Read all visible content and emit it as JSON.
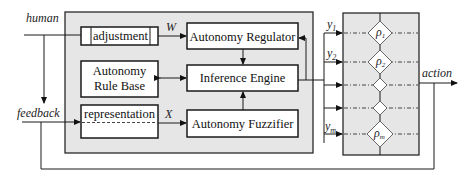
{
  "diagram": {
    "inputs": {
      "human": "human",
      "feedback": "feedback"
    },
    "output": "action",
    "blocks": {
      "adjustment": "adjustment",
      "rule_base_line1": "Autonomy",
      "rule_base_line2": "Rule Base",
      "representation": "representation",
      "regulator": "Autonomy Regulator",
      "inference": "Inference Engine",
      "fuzzifier": "Autonomy Fuzzifier"
    },
    "signals": {
      "w": "W",
      "x": "X"
    },
    "outputs_y": [
      {
        "label": "y",
        "sub": "1"
      },
      {
        "label": "y",
        "sub": "2"
      },
      {
        "label": "y",
        "sub": "m"
      }
    ],
    "selectors": [
      {
        "label": "ρ",
        "sub": "1"
      },
      {
        "label": "ρ",
        "sub": "2"
      },
      {
        "label": "",
        "sub": ""
      },
      {
        "label": "",
        "sub": ""
      },
      {
        "label": "ρ",
        "sub": "m"
      }
    ],
    "colors": {
      "panel": "#e6e6e6",
      "stroke": "#1a1a1a"
    }
  }
}
